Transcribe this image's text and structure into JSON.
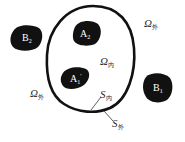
{
  "diagram": {
    "type": "electrostatic-shielding-schematic",
    "colors": {
      "body_fill": "#111111",
      "shell_stroke": "#111111",
      "label_text": "#2a2a2a",
      "body_label_text": "#ffffff",
      "background": "#ffffff"
    },
    "shell": {
      "description": "closed conducting shell (oval)"
    },
    "bodies": [
      {
        "id": "B2",
        "letter": "B",
        "sub": "2",
        "region": "outside"
      },
      {
        "id": "A2",
        "letter": "A",
        "sub": "2",
        "region": "inside"
      },
      {
        "id": "A1",
        "letter": "A",
        "sub": "1",
        "sup": "'",
        "region": "inside"
      },
      {
        "id": "B1",
        "letter": "B",
        "sub": "1",
        "region": "outside"
      }
    ],
    "labels": {
      "omega_outer_top": {
        "symbol": "Ω",
        "sub": "外"
      },
      "omega_inner": {
        "symbol": "Ω",
        "sub": "内"
      },
      "omega_outer_left": {
        "symbol": "Ω",
        "sub": "外"
      },
      "s_inner": {
        "symbol": "S",
        "sub": "内"
      },
      "s_outer": {
        "symbol": "S",
        "sub": "外"
      }
    }
  }
}
